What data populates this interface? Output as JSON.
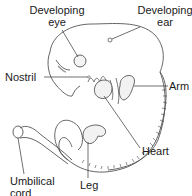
{
  "diagram": {
    "labels": {
      "developing_eye": [
        "Developing",
        "eye"
      ],
      "developing_ear": [
        "Developing",
        "ear"
      ],
      "nostril": "Nostril",
      "arm": "Arm",
      "heart": "Heart",
      "umbilical_cord": [
        "Umbilical",
        "cord"
      ],
      "leg": "Leg"
    },
    "colors": {
      "outline": "#444444",
      "text": "#1a1a1a",
      "shading": "#bbbbbb"
    }
  }
}
